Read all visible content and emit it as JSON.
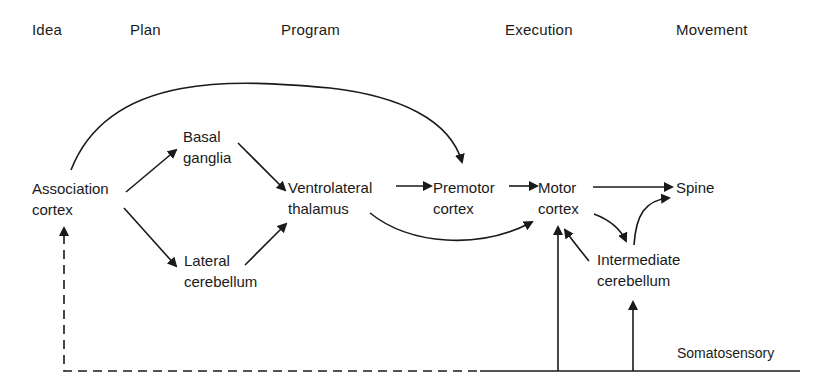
{
  "headers": {
    "idea": "Idea",
    "plan": "Plan",
    "program": "Program",
    "execution": "Execution",
    "movement": "Movement"
  },
  "nodes": {
    "association_cortex": {
      "line1": "Association",
      "line2": "cortex"
    },
    "basal_ganglia": {
      "line1": "Basal",
      "line2": "ganglia"
    },
    "lateral_cerebellum": {
      "line1": "Lateral",
      "line2": "cerebellum"
    },
    "ventrolateral_thalamus": {
      "line1": "Ventrolateral",
      "line2": "thalamus"
    },
    "premotor_cortex": {
      "line1": "Premotor",
      "line2": "cortex"
    },
    "motor_cortex": {
      "line1": "Motor",
      "line2": "cortex"
    },
    "spine": {
      "line1": "Spine"
    },
    "intermediate_cerebellum": {
      "line1": "Intermediate",
      "line2": "cerebellum"
    },
    "somatosensory": {
      "line1": "Somatosensory"
    }
  },
  "edges": [
    {
      "from": "Association cortex",
      "to": "Basal ganglia"
    },
    {
      "from": "Association cortex",
      "to": "Lateral cerebellum"
    },
    {
      "from": "Association cortex",
      "to": "Premotor cortex",
      "style": "curved"
    },
    {
      "from": "Basal ganglia",
      "to": "Ventrolateral thalamus"
    },
    {
      "from": "Lateral cerebellum",
      "to": "Ventrolateral thalamus"
    },
    {
      "from": "Ventrolateral thalamus",
      "to": "Premotor cortex"
    },
    {
      "from": "Ventrolateral thalamus",
      "to": "Motor cortex",
      "style": "curved"
    },
    {
      "from": "Premotor cortex",
      "to": "Motor cortex"
    },
    {
      "from": "Motor cortex",
      "to": "Spine"
    },
    {
      "from": "Motor cortex",
      "to": "Intermediate cerebellum"
    },
    {
      "from": "Intermediate cerebellum",
      "to": "Spine"
    },
    {
      "from": "Intermediate cerebellum",
      "to": "Motor cortex"
    },
    {
      "from": "Somatosensory",
      "to": "Motor cortex"
    },
    {
      "from": "Somatosensory",
      "to": "Intermediate cerebellum"
    },
    {
      "from": "Somatosensory",
      "to": "Association cortex",
      "style": "dashed"
    }
  ]
}
